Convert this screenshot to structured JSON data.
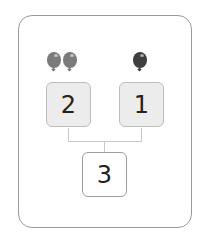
{
  "diagram": {
    "type": "number-bond",
    "parts": [
      {
        "value": "2",
        "balloon_count": 2,
        "balloon_color": "#7a7a7a"
      },
      {
        "value": "1",
        "balloon_count": 1,
        "balloon_color": "#3f3f3f"
      }
    ],
    "whole": {
      "value": "3"
    }
  },
  "colors": {
    "frame_border": "#9a9a9a",
    "part_fill": "#ececec",
    "connector": "#c8c8c8"
  }
}
